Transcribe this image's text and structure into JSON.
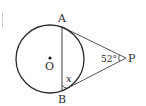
{
  "diagram": {
    "type": "geometry",
    "points": {
      "A": "A",
      "B": "B",
      "O": "O",
      "P": "P"
    },
    "angle_P": "52°",
    "unknown_angle": "x",
    "colors": {
      "stroke": "#2b2b2b",
      "background": "#ffffff"
    }
  }
}
